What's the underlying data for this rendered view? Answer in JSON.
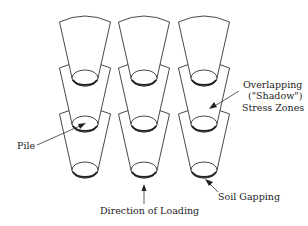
{
  "diagram": {
    "columns": [
      85,
      144,
      204
    ],
    "rows": [
      {
        "top_y": 22,
        "pile_y": 78
      },
      {
        "top_y": 68,
        "pile_y": 124
      },
      {
        "top_y": 114,
        "pile_y": 170
      }
    ],
    "labels": {
      "pile": "Pile",
      "overlap_line1": "Overlapping",
      "overlap_line2": "(\"Shadow\")",
      "overlap_line3": "Stress Zones",
      "soil_gapping": "Soil Gapping",
      "direction": "Direction of Loading"
    },
    "colors": {
      "line": "#333333",
      "background": "#ffffff"
    }
  }
}
